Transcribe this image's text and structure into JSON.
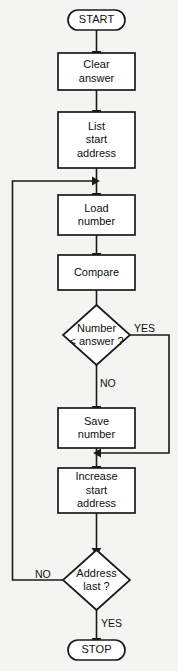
{
  "diagram": {
    "background_color": "#f4f4f2",
    "line_color": "#1a1a1a",
    "node_fill": "#ffffff",
    "text_color": "#101010"
  },
  "nodes": {
    "start": {
      "label": "START",
      "shape": "terminator"
    },
    "clear_answer": {
      "label": "Clear\nanswer",
      "shape": "process"
    },
    "list_start_address": {
      "label": "List\nstart\naddress",
      "shape": "process"
    },
    "load_number": {
      "label": "Load\nnumber",
      "shape": "process"
    },
    "compare": {
      "label": "Compare",
      "shape": "process"
    },
    "number_lt_answer": {
      "label": "Number\n< answer ?",
      "shape": "decision"
    },
    "save_number": {
      "label": "Save\nnumber",
      "shape": "process"
    },
    "increase_start_address": {
      "label": "Increase\nstart\naddress",
      "shape": "process"
    },
    "address_last": {
      "label": "Address\nlast ?",
      "shape": "decision"
    },
    "stop": {
      "label": "STOP",
      "shape": "terminator"
    }
  },
  "edge_labels": {
    "number_yes": "YES",
    "number_no": "NO",
    "address_no": "NO",
    "address_yes": "YES"
  },
  "flow": {
    "description": "START to Clear answer to List start address to Load number to Compare to Number < answer decision; YES bypasses Save number, NO goes through Save number; both rejoin at Increase start address; Address last decision returns NO to Load number and YES to STOP."
  }
}
